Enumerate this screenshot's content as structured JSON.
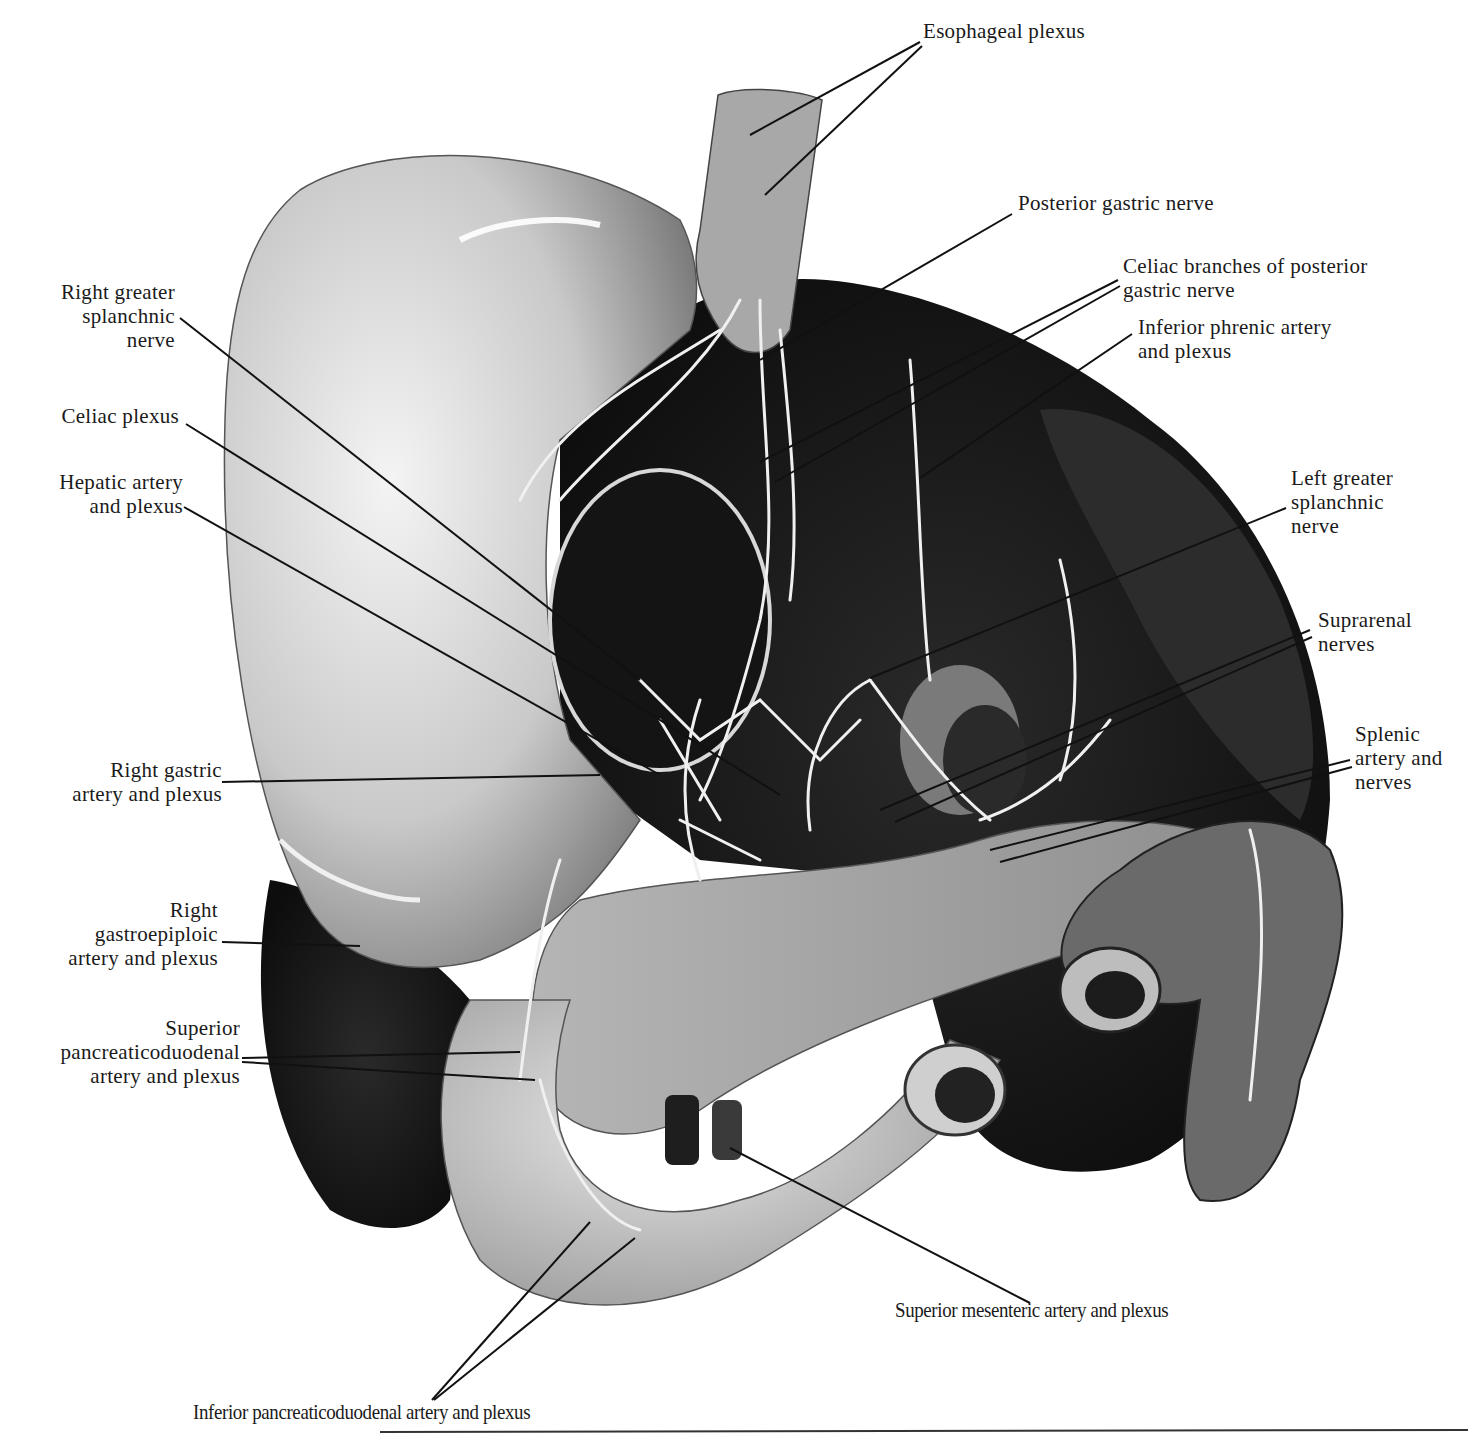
{
  "figure": {
    "colors": {
      "background": "#ffffff",
      "dark_tissue": "#1c1c1c",
      "mid_tissue": "#8a8a8a",
      "light_tissue": "#d6d6d6",
      "nerve": "#f2f2f2",
      "leader_line": "#111111"
    }
  },
  "labels": {
    "esophageal_plexus": "Esophageal plexus",
    "posterior_gastric_nerve": "Posterior gastric nerve",
    "celiac_branches": "Celiac branches of posterior\ngastric nerve",
    "inferior_phrenic": "Inferior phrenic artery\nand plexus",
    "left_greater_splanchnic": "Left greater\nsplanchnic\nnerve",
    "suprarenal_nerves": "Suprarenal\nnerves",
    "splenic_artery": "Splenic\nartery and\nnerves",
    "right_greater_splanchnic": "Right greater\nsplanchnic\nnerve",
    "celiac_plexus": "Celiac plexus",
    "hepatic_artery": "Hepatic artery\nand plexus",
    "right_gastric": "Right gastric\nartery and plexus",
    "right_gastroepiploic": "Right\ngastroepiploic\nartery and plexus",
    "superior_pancreaticoduodenal": "Superior\npancreaticoduodenal\nartery and plexus",
    "superior_mesenteric": "Superior mesenteric artery and plexus",
    "inferior_pancreaticoduodenal": "Inferior pancreaticoduodenal artery and plexus"
  }
}
